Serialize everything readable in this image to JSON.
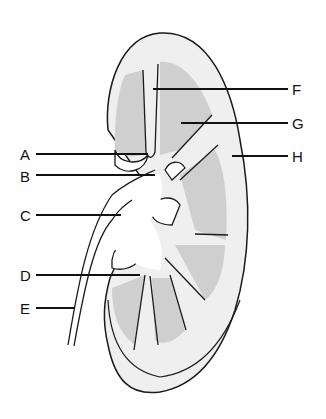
{
  "diagram": {
    "colors": {
      "background": "#ffffff",
      "cortex": "#efefef",
      "medulla": "#cfcfcf",
      "outline": "#1a1a1a"
    },
    "labels": [
      {
        "id": "A",
        "text": "A"
      },
      {
        "id": "B",
        "text": "B"
      },
      {
        "id": "C",
        "text": "C"
      },
      {
        "id": "D",
        "text": "D"
      },
      {
        "id": "E",
        "text": "E"
      },
      {
        "id": "F",
        "text": "F"
      },
      {
        "id": "G",
        "text": "G"
      },
      {
        "id": "H",
        "text": "H"
      }
    ]
  }
}
